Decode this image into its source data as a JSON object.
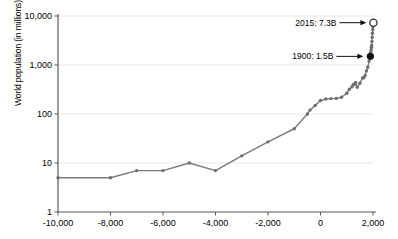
{
  "chart_data": {
    "type": "line",
    "title": "",
    "xlabel": "",
    "ylabel": "World population (in millions)",
    "xlim": [
      -10000,
      2000
    ],
    "ylim": [
      1,
      10000
    ],
    "yscale": "log",
    "grid": true,
    "legend": null,
    "line_color": "#7a7a7a",
    "marker_color": "#6e6e6e",
    "axis_color": "#595959",
    "gridline_color": "#e8e8e8",
    "yticks": [
      {
        "value": 10000,
        "label": "10,000"
      },
      {
        "value": 1000,
        "label": "1,000"
      },
      {
        "value": 100,
        "label": "100"
      },
      {
        "value": 10,
        "label": "10"
      },
      {
        "value": 1,
        "label": "1"
      }
    ],
    "xticks": [
      {
        "value": -10000,
        "label": "-10,000"
      },
      {
        "value": -8000,
        "label": "-8,000"
      },
      {
        "value": -6000,
        "label": "-6,000"
      },
      {
        "value": -4000,
        "label": "-4,000"
      },
      {
        "value": -2000,
        "label": "-2,000"
      },
      {
        "value": 0,
        "label": "0"
      },
      {
        "value": 2000,
        "label": "2,000"
      }
    ],
    "x": [
      -10000,
      -8000,
      -7000,
      -6000,
      -5000,
      -4000,
      -3000,
      -2000,
      -1000,
      -500,
      -400,
      -200,
      0,
      200,
      400,
      600,
      800,
      1000,
      1100,
      1200,
      1250,
      1300,
      1340,
      1400,
      1500,
      1600,
      1650,
      1700,
      1750,
      1800,
      1850,
      1900,
      1910,
      1920,
      1930,
      1940,
      1950,
      1960,
      1970,
      1980,
      1990,
      2000,
      2015
    ],
    "values": [
      5,
      5,
      7,
      7,
      10,
      7,
      14,
      27,
      50,
      100,
      120,
      150,
      188,
      202,
      206,
      208,
      220,
      265,
      320,
      360,
      400,
      400,
      442,
      350,
      425,
      545,
      550,
      610,
      760,
      900,
      1200,
      1500,
      1750,
      1860,
      2070,
      2300,
      2500,
      3030,
      3700,
      4440,
      5300,
      6100,
      7300
    ],
    "markers": [
      {
        "x": 1900,
        "y": 1500,
        "style": "filled",
        "color": "#111111"
      },
      {
        "x": 2015,
        "y": 7300,
        "style": "hollow",
        "color": "#ffffff",
        "edge": "#333333"
      }
    ],
    "annotations": [
      {
        "text": "2015: 7.3B",
        "target_x": 2015,
        "target_y": 7300
      },
      {
        "text": "1900: 1.5B",
        "target_x": 1900,
        "target_y": 1500
      }
    ]
  }
}
